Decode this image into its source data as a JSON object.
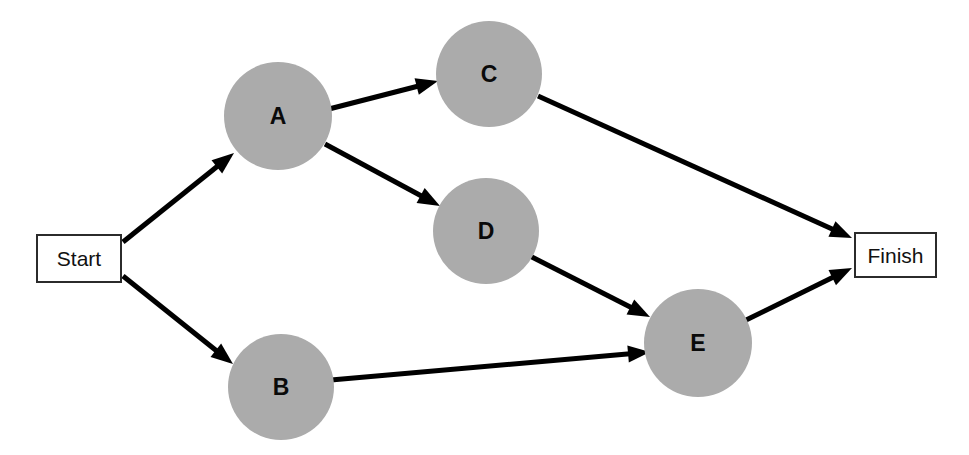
{
  "diagram": {
    "type": "activity-network-diagram",
    "canvas": {
      "width": 969,
      "height": 455,
      "background": "#ffffff"
    },
    "style": {
      "node_fill": "#ababab",
      "terminal_fill": "#ffffff",
      "terminal_border": "#2b2b2b",
      "edge_color": "#000000",
      "edge_width": 5,
      "label_color": "#0a0a0a"
    },
    "nodes": [
      {
        "id": "start",
        "label": "Start",
        "shape": "rect",
        "x": 36,
        "y": 234,
        "w": 86,
        "h": 49
      },
      {
        "id": "a",
        "label": "A",
        "shape": "circle",
        "cx": 278,
        "cy": 116,
        "r": 54
      },
      {
        "id": "b",
        "label": "B",
        "shape": "circle",
        "cx": 281,
        "cy": 387,
        "r": 53
      },
      {
        "id": "c",
        "label": "C",
        "shape": "circle",
        "cx": 489,
        "cy": 74,
        "r": 53
      },
      {
        "id": "d",
        "label": "D",
        "shape": "circle",
        "cx": 486,
        "cy": 231,
        "r": 53
      },
      {
        "id": "e",
        "label": "E",
        "shape": "circle",
        "cx": 698,
        "cy": 343,
        "r": 54
      },
      {
        "id": "finish",
        "label": "Finish",
        "shape": "rect",
        "x": 854,
        "y": 232,
        "w": 83,
        "h": 46
      }
    ],
    "edges": [
      {
        "id": "start-a",
        "from": "Start",
        "to": "A",
        "x1": 123,
        "y1": 242,
        "x2": 234,
        "y2": 153
      },
      {
        "id": "start-b",
        "from": "Start",
        "to": "B",
        "x1": 123,
        "y1": 276,
        "x2": 233,
        "y2": 364
      },
      {
        "id": "a-c",
        "from": "A",
        "to": "C",
        "x1": 329,
        "y1": 109,
        "x2": 438,
        "y2": 81
      },
      {
        "id": "a-d",
        "from": "A",
        "to": "D",
        "x1": 325,
        "y1": 144,
        "x2": 440,
        "y2": 206
      },
      {
        "id": "c-finish",
        "from": "C",
        "to": "Finish",
        "x1": 538,
        "y1": 96,
        "x2": 852,
        "y2": 238
      },
      {
        "id": "d-e",
        "from": "D",
        "to": "E",
        "x1": 528,
        "y1": 255,
        "x2": 650,
        "y2": 317
      },
      {
        "id": "b-e",
        "from": "B",
        "to": "E",
        "x1": 331,
        "y1": 380,
        "x2": 650,
        "y2": 352
      },
      {
        "id": "e-finish",
        "from": "E",
        "to": "Finish",
        "x1": 742,
        "y1": 322,
        "x2": 852,
        "y2": 268
      }
    ]
  }
}
